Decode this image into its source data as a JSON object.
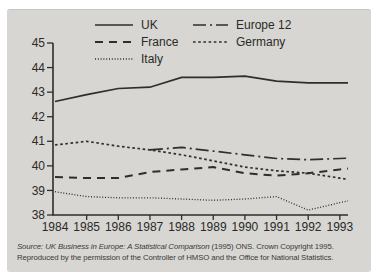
{
  "panel": {
    "background": "#d7d6d2",
    "line_color": "#2e2e2c",
    "text_color": "#2a2a28"
  },
  "source": {
    "line1_italic": "Source: UK Business in Europe: A Statistical Comparison",
    "line1_regular": " (1995) ONS. Crown Copyright 1995.",
    "line2": "Reproduced by the permission of the Controller of HMSO and the Office for National Statistics."
  },
  "chart_data": {
    "type": "line",
    "x": [
      1984,
      1985,
      1986,
      1987,
      1988,
      1989,
      1990,
      1991,
      1992,
      1993
    ],
    "series": [
      {
        "name": "UK",
        "style": "solid",
        "values": [
          42.62,
          42.9,
          43.15,
          43.2,
          43.6,
          43.6,
          43.65,
          43.45,
          43.38,
          43.38
        ]
      },
      {
        "name": "Europe 12",
        "style": "dash-dot",
        "values": [
          null,
          null,
          null,
          40.65,
          40.75,
          40.6,
          40.45,
          40.3,
          40.25,
          40.3
        ]
      },
      {
        "name": "France",
        "style": "dashed",
        "values": [
          39.55,
          39.5,
          39.5,
          39.75,
          39.85,
          39.95,
          39.7,
          39.6,
          39.7,
          39.85
        ]
      },
      {
        "name": "Germany",
        "style": "dotted",
        "values": [
          40.85,
          41.0,
          40.8,
          40.65,
          40.45,
          40.2,
          39.95,
          39.8,
          39.7,
          39.5
        ]
      },
      {
        "name": "Italy",
        "style": "fine-dotted",
        "values": [
          38.95,
          38.75,
          38.7,
          38.7,
          38.65,
          38.6,
          38.65,
          38.75,
          38.2,
          38.5
        ]
      }
    ],
    "ylim": [
      38,
      45
    ],
    "yticks": [
      45,
      44,
      43,
      42,
      41,
      40,
      39,
      38
    ],
    "grid": false,
    "legend_position": "top-inside",
    "title": "",
    "xlabel": "",
    "ylabel": ""
  }
}
